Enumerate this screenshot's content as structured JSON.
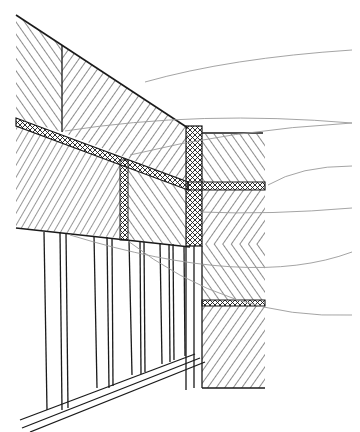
{
  "diagram": {
    "title": "",
    "colors": {
      "ink": "#1a1a1a",
      "leader": "#9a9a9a",
      "background": "#ffffff"
    },
    "leaders": [
      {
        "id": "leader-1",
        "from": [
          352,
          50
        ],
        "to": [
          145,
          82
        ]
      },
      {
        "id": "leader-2",
        "from": [
          352,
          123
        ],
        "to": [
          65,
          131
        ]
      },
      {
        "id": "leader-3",
        "from": [
          352,
          123
        ],
        "to": [
          130,
          155
        ]
      },
      {
        "id": "leader-4",
        "from": [
          352,
          166
        ],
        "to": [
          268,
          185
        ]
      },
      {
        "id": "leader-5",
        "from": [
          352,
          208
        ],
        "to": [
          200,
          212
        ]
      },
      {
        "id": "leader-6",
        "from": [
          352,
          252
        ],
        "to": [
          70,
          235
        ]
      },
      {
        "id": "leader-7",
        "from": [
          352,
          315
        ],
        "to": [
          128,
          241
        ]
      }
    ],
    "labels": []
  }
}
